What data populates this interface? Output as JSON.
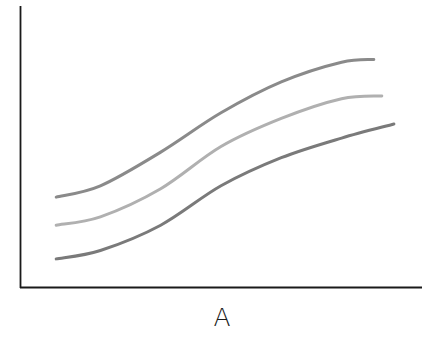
{
  "chart_data": {
    "type": "line",
    "title": "",
    "xlabel": "A",
    "ylabel": "",
    "grid": false,
    "legend": null,
    "axis_ticks": false,
    "xlim": [
      0,
      1
    ],
    "ylim": [
      0,
      1
    ],
    "series": [
      {
        "name": "upper",
        "color": "#8a8a8a",
        "x": [
          0.09,
          0.2,
          0.35,
          0.5,
          0.65,
          0.8,
          0.88
        ],
        "y": [
          0.32,
          0.36,
          0.48,
          0.62,
          0.73,
          0.8,
          0.81
        ]
      },
      {
        "name": "middle",
        "color": "#b0b0b0",
        "x": [
          0.09,
          0.2,
          0.35,
          0.5,
          0.65,
          0.8,
          0.9
        ],
        "y": [
          0.22,
          0.25,
          0.35,
          0.5,
          0.6,
          0.67,
          0.68
        ]
      },
      {
        "name": "lower",
        "color": "#7a7a7a",
        "x": [
          0.09,
          0.2,
          0.35,
          0.5,
          0.65,
          0.8,
          0.93
        ],
        "y": [
          0.1,
          0.13,
          0.22,
          0.36,
          0.46,
          0.53,
          0.58
        ]
      }
    ]
  },
  "axes": {
    "color": "#1a1a1a"
  }
}
